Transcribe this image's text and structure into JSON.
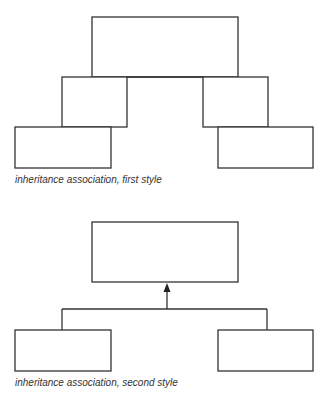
{
  "diagram_1": {
    "caption": "inheritance association, first style",
    "style": "nested-overlap",
    "boxes": [
      {
        "id": "parent",
        "x": 92,
        "y": 17,
        "w": 146,
        "h": 60
      },
      {
        "id": "child-left",
        "x": 62,
        "y": 77,
        "w": 65,
        "h": 50
      },
      {
        "id": "child-right",
        "x": 203,
        "y": 77,
        "w": 65,
        "h": 50
      },
      {
        "id": "grandchild-left",
        "x": 15,
        "y": 127,
        "w": 96,
        "h": 41
      },
      {
        "id": "grandchild-right",
        "x": 218,
        "y": 127,
        "w": 95,
        "h": 41
      }
    ]
  },
  "diagram_2": {
    "caption": "inheritance association, second style",
    "style": "arrow-tree",
    "boxes": [
      {
        "id": "parent",
        "x": 92,
        "y": 222,
        "w": 146,
        "h": 60
      },
      {
        "id": "child-left",
        "x": 15,
        "y": 330,
        "w": 96,
        "h": 41
      },
      {
        "id": "child-right",
        "x": 218,
        "y": 330,
        "w": 95,
        "h": 41
      }
    ],
    "connector": {
      "arrow_x": 167,
      "arrow_tip_y": 283,
      "bar_y": 309,
      "left_x": 62,
      "right_x": 267
    }
  },
  "colors": {
    "stroke": "#333333",
    "background": "#ffffff"
  }
}
